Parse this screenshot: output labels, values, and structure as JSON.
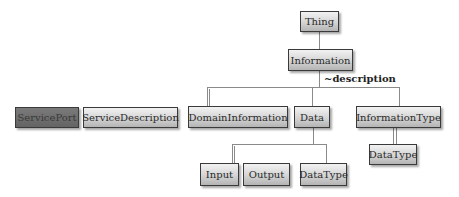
{
  "diagram": {
    "type": "class-hierarchy",
    "nodes": {
      "thing": "Thing",
      "information": "Information",
      "service_port": "ServicePort",
      "service_description": "ServiceDescription",
      "domain_information": "DomainInformation",
      "data": "Data",
      "information_type": "InformationType",
      "input": "Input",
      "output": "Output",
      "data_type_1": "DataType",
      "data_type_2": "DataType"
    },
    "edge_labels": {
      "description": "~description"
    },
    "edges": [
      {
        "from": "Thing",
        "to": "Information"
      },
      {
        "from": "Information",
        "to": "DomainInformation",
        "label": "~description"
      },
      {
        "from": "Information",
        "to": "Data",
        "label": "~description"
      },
      {
        "from": "Information",
        "to": "InformationType",
        "label": "~description"
      },
      {
        "from": "Data",
        "to": "Input"
      },
      {
        "from": "Data",
        "to": "DataType"
      },
      {
        "from": "InformationType",
        "to": "DataType"
      }
    ],
    "colors": {
      "node_fill_top": "#f2f2f2",
      "node_fill_bottom": "#b4b4b4",
      "highlight_node_fill": "#6a6a6a",
      "border": "#3a3a3a",
      "connector": "#8a8a8a"
    }
  }
}
